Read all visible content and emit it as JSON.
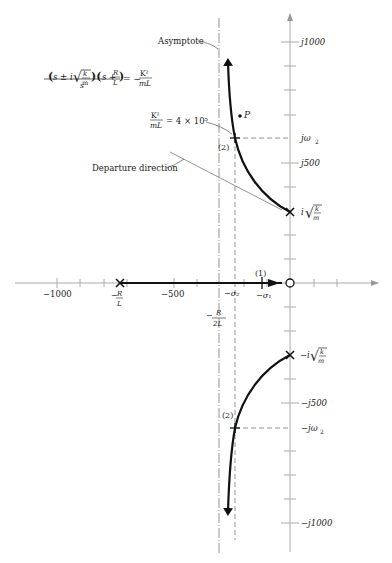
{
  "figure": {
    "type": "root-locus",
    "equation": {
      "numerator_left": "(s ± i√(k/m))(s + R/L)",
      "denominator": "s",
      "rhs": "= − K²/(mL)",
      "sqrt_num": "k",
      "sqrt_den": "m",
      "frac_R": "R",
      "frac_L": "L",
      "K2": "K²",
      "mL": "mL",
      "s": "s",
      "s_pm_i": "s ± i",
      "s_plus": "s +",
      "eq_minus": "= −"
    },
    "gain_label": {
      "lhs_num": "K²",
      "lhs_den": "mL",
      "rhs": "= 4 × 10⁵"
    },
    "labels": {
      "asymptote": "Asymptote",
      "departure": "Departure direction",
      "point_P": "P",
      "multiplicity_upper": "(2)",
      "multiplicity_lower": "(2)",
      "multiplicity_real": "(1)",
      "neg_sigma2": "−σ₂",
      "neg_sigma1": "−σ₁",
      "neg_R_over_L_num": "R",
      "neg_R_over_L_den": "L",
      "neg_R_over_2L_num": "R",
      "neg_R_over_2L_den": "2L",
      "minus": "−"
    },
    "real_axis_ticks": [
      {
        "label": "−1000",
        "value": -1000
      },
      {
        "label": "−500",
        "value": -500
      }
    ],
    "imag_axis_ticks": [
      {
        "label": "j1000",
        "value": 1000
      },
      {
        "label": "jω₂",
        "value": 620
      },
      {
        "label": "j500",
        "value": 500
      },
      {
        "label": "i√(k/m)",
        "value": 300
      },
      {
        "label": "−i√(k/m)",
        "value": -300
      },
      {
        "label": "−j500",
        "value": -500
      },
      {
        "label": "−jω₂",
        "value": -620
      },
      {
        "label": "−j1000",
        "value": -1000
      }
    ],
    "imag_labels": {
      "j1000": "j1000",
      "jw2": "jω",
      "w2_sub": "2",
      "j500": "j500",
      "pole_pos_prefix": "i",
      "pole_neg_prefix": "−i",
      "neg_j500": "−j500",
      "neg_jw2": "−jω",
      "neg_j1000": "−j1000"
    },
    "poles": [
      {
        "name": "i√(k/m)",
        "re": 0,
        "im": 300
      },
      {
        "name": "−i√(k/m)",
        "re": 0,
        "im": -300
      },
      {
        "name": "−R/L",
        "re": -730,
        "im": 0
      }
    ],
    "zeros": [
      {
        "name": "origin",
        "re": 0,
        "im": 0
      }
    ],
    "colors": {
      "axis": "#999999",
      "locus": "#111111",
      "text": "#222222",
      "guide": "#888888"
    }
  }
}
